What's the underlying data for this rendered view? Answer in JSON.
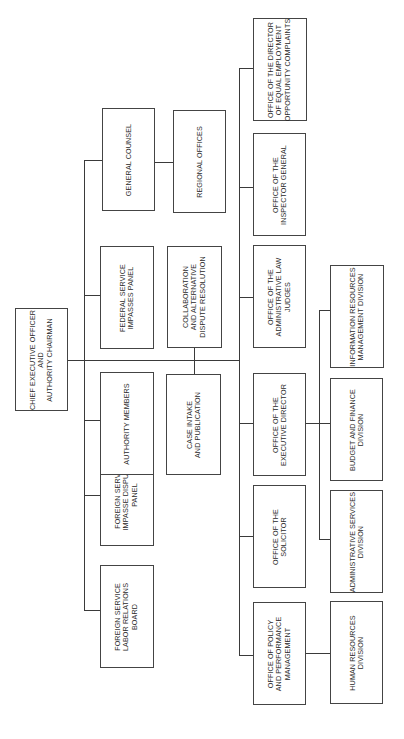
{
  "chart": {
    "orientation": "rotated-90-ccw",
    "root": {
      "label": "CHIEF EXECUTIVE OFFICER\nAND\nAUTHORITY CHAIRMAN"
    },
    "upper_branch": [
      {
        "label": "FOREIGN SERVICE\nLABOR RELATIONS\nBOARD"
      },
      {
        "label": "FOREIGN SERVICE\nIMPASSE DISPUTES\nPANEL"
      },
      {
        "label": "AUTHORITY MEMBERS"
      },
      {
        "label": "FEDERAL SERVICE\nIMPASSES PANEL"
      },
      {
        "label": "GENERAL COUNSEL"
      }
    ],
    "general_counsel_child": {
      "label": "REGIONAL OFFICES"
    },
    "middle_branch": [
      {
        "label": "CASE INTAKE\nAND PUBLICATION"
      },
      {
        "label": "COLLABORATION\nAND ALTERNATIVE\nDISPUTE RESOLUTION"
      }
    ],
    "lower_branch": [
      {
        "label": "OFFICE OF POLICY\nAND PERFORMANCE\nMANAGEMENT"
      },
      {
        "label": "OFFICE OF THE\nSOLICITOR"
      },
      {
        "label": "OFFICE OF THE\nEXECUTIVE DIRECTOR"
      },
      {
        "label": "OFFICE OF THE\nADMINISTRATIVE LAW\nJUDGES"
      },
      {
        "label": "OFFICE OF THE\nINSPECTOR GENERAL"
      },
      {
        "label": "OFFICE OF THE DIRECTOR\nOF EQUAL EMPLOYMENT\nOPPORTUNITY COMPLAINTS"
      }
    ],
    "policy_child": {
      "label": "HUMAN RESOURCES\nDIVISION"
    },
    "executive_director_children": [
      {
        "label": "ADMINISTRATIVE SERVICES\nDIVISION"
      },
      {
        "label": "BUDGET AND FINANCE\nDIVISION"
      },
      {
        "label": "INFORMATION RESOURCES\nMANAGEMENT DIVISION"
      }
    ]
  }
}
